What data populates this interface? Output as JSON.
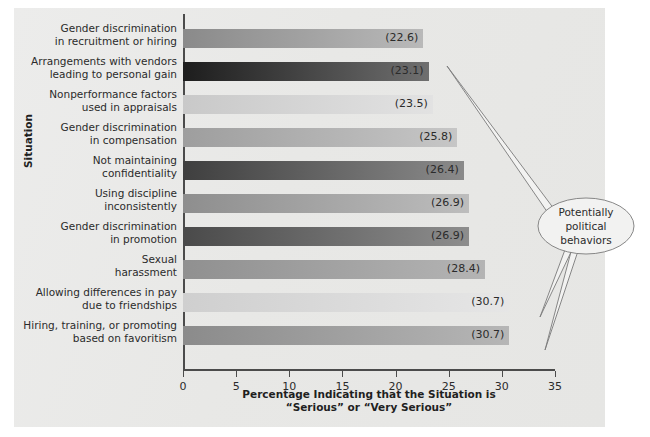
{
  "chart_data": {
    "type": "bar",
    "orientation": "horizontal",
    "title": "",
    "xlabel": "Percentage Indicating that the Situation is “Serious” or “Very Serious”",
    "xlabel_line1": "Percentage Indicating that the Situation is",
    "xlabel_line2": "“Serious” or “Very Serious”",
    "ylabel": "Situation",
    "xlim": [
      0,
      35
    ],
    "xticks": [
      0,
      5,
      10,
      15,
      20,
      25,
      30,
      35
    ],
    "xtick_labels": [
      "0",
      "5",
      "10",
      "15",
      "20",
      "25",
      "30",
      "35"
    ],
    "grid": false,
    "legend": "none",
    "categories": [
      "Gender discrimination in recruitment or hiring",
      "Arrangements with vendors leading to personal gain",
      "Nonperformance factors used in appraisals",
      "Gender discrimination in compensation",
      "Not maintaining confidentiality",
      "Using discipline inconsistently",
      "Gender discrimination in promotion",
      "Sexual harassment",
      "Allowing differences in pay due to friendships",
      "Hiring, training, or promoting based on favoritism"
    ],
    "category_lines": [
      [
        "Gender discrimination",
        "in recruitment or hiring"
      ],
      [
        "Arrangements with vendors",
        "leading to personal gain"
      ],
      [
        "Nonperformance factors",
        "used in appraisals"
      ],
      [
        "Gender discrimination",
        "in compensation"
      ],
      [
        "Not maintaining",
        "confidentiality"
      ],
      [
        "Using discipline",
        "inconsistently"
      ],
      [
        "Gender discrimination",
        "in promotion"
      ],
      [
        "Sexual",
        "harassment"
      ],
      [
        "Allowing differences in pay",
        "due to friendships"
      ],
      [
        "Hiring, training, or promoting",
        "based on favoritism"
      ]
    ],
    "values": [
      22.6,
      23.1,
      23.5,
      25.8,
      26.4,
      26.9,
      26.9,
      28.4,
      30.7,
      30.7
    ],
    "value_labels": [
      "(22.6)",
      "(23.1)",
      "(23.5)",
      "(25.8)",
      "(26.4)",
      "(26.9)",
      "(26.9)",
      "(28.4)",
      "(30.7)",
      "(30.7)"
    ],
    "bar_colors": [
      "#8a8a8a",
      "#1d1d1d",
      "#c9c9c9",
      "#9e9e9e",
      "#3f3f3f",
      "#8e8e8e",
      "#4a4a4a",
      "#909090",
      "#cfcfcf",
      "#8b8b8b"
    ],
    "bar_colors_end": [
      "#b9b9b9",
      "#6f6f6f",
      "#e2e2e2",
      "#c6c6c6",
      "#8a8a8a",
      "#bdbdbd",
      "#8d8d8d",
      "#b4b4b4",
      "#e6e6e6",
      "#b6b6b6"
    ]
  },
  "annotation": {
    "callout_line1": "Potentially",
    "callout_line2": "political",
    "callout_line3": "behaviors",
    "points_to": [
      1,
      8,
      9
    ]
  },
  "colors": {
    "panel_background": "#e9e9e7",
    "axis": "#4b4b4b",
    "text": "#2b2b2b",
    "callout_stroke": "#6f6f6f"
  }
}
